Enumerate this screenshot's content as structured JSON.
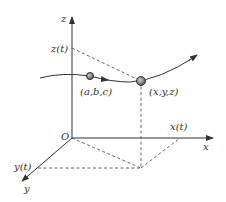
{
  "diagram": {
    "type": "3d-parametric-curve",
    "axes": {
      "x_label": "x",
      "y_label": "y",
      "z_label": "z",
      "origin_label": "O"
    },
    "projections": {
      "x_t": "x(t)",
      "y_t": "y(t)",
      "z_t": "z(t)"
    },
    "points": [
      {
        "label": "(a,b,c)"
      },
      {
        "label": "(x,y,z)"
      }
    ],
    "colors": {
      "stroke": "#333333",
      "dashed": "#555555",
      "point_fill": "#888888"
    }
  }
}
